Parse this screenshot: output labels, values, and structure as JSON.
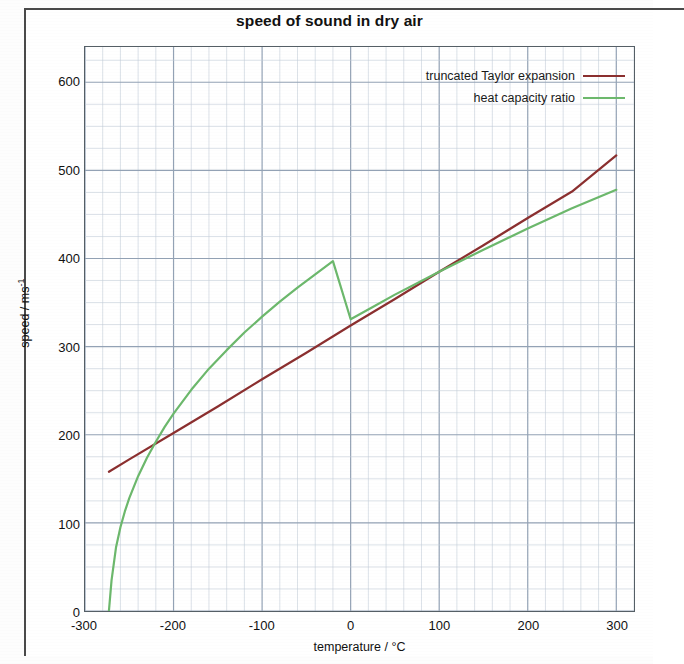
{
  "chart_data": {
    "type": "line",
    "title": "speed of sound in dry air",
    "xlabel": "temperature / °C",
    "ylabel": "speed / ms",
    "ylabel_exponent": "-1",
    "xlim": [
      -300,
      320
    ],
    "ylim": [
      0,
      640
    ],
    "x_ticks": [
      -300,
      -200,
      -100,
      0,
      100,
      200,
      300
    ],
    "y_ticks": [
      0,
      100,
      200,
      300,
      400,
      500,
      600
    ],
    "x_tick_labels": [
      "-300",
      "-200",
      "-100",
      "0",
      "100",
      "200",
      "300"
    ],
    "y_tick_labels": [
      "0",
      "100",
      "200",
      "300",
      "400",
      "500",
      "600"
    ],
    "x_major_step": 100,
    "x_minor_step": 20,
    "y_major_step": 100,
    "y_minor_step": 25,
    "grid": true,
    "grid_color": "#93a2b5",
    "grid_minor_color": "#c3ccd8",
    "axis_color": "#555f66",
    "legend_position": "top-right-inside",
    "series": [
      {
        "name": "truncated Taylor expansion",
        "color": "#8b2f2f",
        "x": [
          -273,
          -250,
          -200,
          -150,
          -100,
          -50,
          0,
          50,
          100,
          150,
          200,
          250,
          300
        ],
        "values": [
          158,
          172,
          202,
          232,
          263,
          293,
          324,
          354,
          385,
          415,
          446,
          476,
          517
        ]
      },
      {
        "name": "heat capacity ratio",
        "color": "#6cb86c",
        "x": [
          -273,
          -270,
          -265,
          -260,
          -255,
          -250,
          -240,
          -230,
          -220,
          -210,
          -200,
          -180,
          -160,
          -140,
          -120,
          -100,
          -80,
          -60,
          -40,
          -20,
          0,
          25,
          50,
          75,
          100,
          150,
          200,
          250,
          300
        ],
        "values": [
          0,
          35,
          72,
          95,
          113,
          128,
          153,
          174,
          192,
          209,
          224,
          251,
          275,
          296,
          316,
          334,
          351,
          367,
          382,
          397,
          331,
          345,
          359,
          372,
          385,
          410,
          434,
          457,
          478
        ]
      }
    ]
  },
  "chart": {
    "title": "speed of sound in dry air",
    "legend": [
      {
        "label": "truncated Taylor expansion",
        "color": "#8b2f2f"
      },
      {
        "label": "heat capacity ratio",
        "color": "#6cb86c"
      }
    ],
    "axes": {
      "x_title": "temperature / °C",
      "y_title_main": "speed / ms",
      "y_title_sup": "-1"
    }
  }
}
